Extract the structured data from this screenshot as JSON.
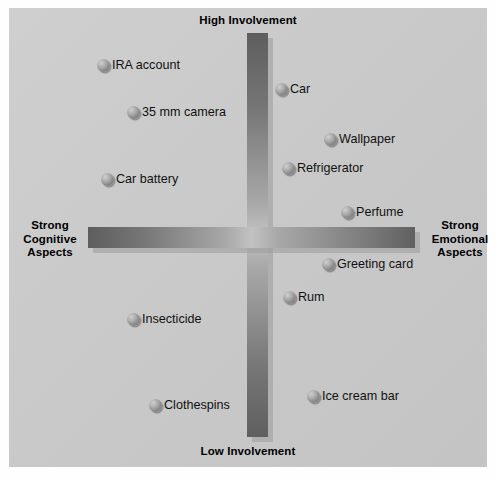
{
  "chart_data": {
    "type": "scatter",
    "title": "",
    "xlabel": "Cognitive ↔ Emotional Aspects",
    "ylabel": "Involvement",
    "axis_labels": {
      "top": "High Involvement",
      "bottom": "Low Involvement",
      "left": "Strong\nCognitive\nAspects",
      "right": "Strong\nEmotional\nAspects"
    },
    "xlim": [
      -1,
      1
    ],
    "ylim": [
      -1,
      1
    ],
    "grid": false,
    "legend": "none",
    "quadrants": [
      "high-involvement / cognitive",
      "high-involvement / emotional",
      "low-involvement / cognitive",
      "low-involvement / emotional"
    ],
    "points": [
      {
        "label": "IRA account",
        "x": -0.62,
        "y": 0.74,
        "px": 103,
        "py": 66,
        "quadrant": "high-involvement / cognitive"
      },
      {
        "label": "35 mm camera",
        "x": -0.48,
        "y": 0.54,
        "px": 133,
        "py": 113,
        "quadrant": "high-involvement / cognitive"
      },
      {
        "label": "Car battery",
        "x": -0.61,
        "y": 0.28,
        "px": 107,
        "py": 180,
        "quadrant": "high-involvement / cognitive"
      },
      {
        "label": "Car",
        "x": 0.11,
        "y": 0.64,
        "px": 281,
        "py": 90,
        "quadrant": "high-involvement / emotional"
      },
      {
        "label": "Wallpaper",
        "x": 0.33,
        "y": 0.44,
        "px": 330,
        "py": 140,
        "quadrant": "high-involvement / emotional"
      },
      {
        "label": "Refrigerator",
        "x": 0.15,
        "y": 0.32,
        "px": 288,
        "py": 169,
        "quadrant": "high-involvement / emotional"
      },
      {
        "label": "Perfume",
        "x": 0.45,
        "y": 0.14,
        "px": 347,
        "py": 213,
        "quadrant": "high-involvement / emotional"
      },
      {
        "label": "Greeting card",
        "x": 0.36,
        "y": -0.12,
        "px": 328,
        "py": 265,
        "quadrant": "low-involvement / emotional"
      },
      {
        "label": "Rum",
        "x": 0.17,
        "y": -0.28,
        "px": 289,
        "py": 298,
        "quadrant": "low-involvement / emotional"
      },
      {
        "label": "Ice cream bar",
        "x": 0.3,
        "y": -0.74,
        "px": 313,
        "py": 397,
        "quadrant": "low-involvement / emotional"
      },
      {
        "label": "Insecticide",
        "x": -0.48,
        "y": -0.38,
        "px": 133,
        "py": 320,
        "quadrant": "low-involvement / cognitive"
      },
      {
        "label": "Clothespins",
        "x": -0.38,
        "y": -0.79,
        "px": 155,
        "py": 406,
        "quadrant": "low-involvement / cognitive"
      }
    ]
  },
  "figure": {
    "top_label": "High Involvement",
    "bottom_label": "Low Involvement",
    "left_label": "Strong\nCognitive\nAspects",
    "right_label": "Strong\nEmotional\nAspects",
    "panel_color": "#c9c9c9",
    "axis_color": "#6e6e6e",
    "marker_color": "#8b8b8b",
    "text_color": "#111111"
  }
}
